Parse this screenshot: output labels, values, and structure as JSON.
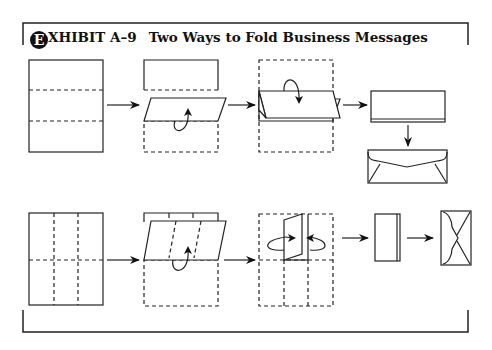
{
  "exhibit": {
    "badge_letter": "E",
    "label_rest": "XHIBIT A–9",
    "title": "Two Ways to Fold Business Messages"
  },
  "diagram": {
    "rows": [
      {
        "name": "letter-fold",
        "steps": [
          "flat-sheet-thirds",
          "fold-bottom-third-up",
          "fold-top-third-down",
          "folded-letter",
          "business-envelope"
        ]
      },
      {
        "name": "accordion-fold",
        "steps": [
          "flat-sheet-half-and-thirds",
          "fold-bottom-half-up",
          "fold-sides-in",
          "folded-narrow",
          "small-envelope"
        ]
      }
    ],
    "colors": {
      "line": "#222222",
      "background": "#ffffff"
    }
  }
}
